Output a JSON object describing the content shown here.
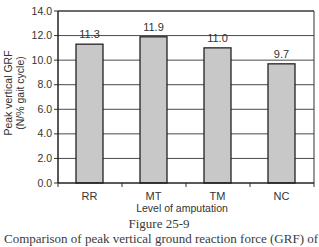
{
  "chart_data": {
    "type": "bar",
    "title": "",
    "categories": [
      "RR",
      "MT",
      "TM",
      "NC"
    ],
    "values": [
      11.3,
      11.9,
      11.0,
      9.7
    ],
    "data_labels": [
      "11.3",
      "11.9",
      "11.0",
      "9.7"
    ],
    "xlabel": "Level of amputation",
    "ylabel_lines": [
      "Peak vertical GRF",
      "(N/% gait cycle)"
    ],
    "ylim": [
      0,
      14
    ],
    "yticks": [
      0,
      2,
      4,
      6,
      8,
      10,
      12,
      14
    ],
    "ytick_labels": [
      "0.0",
      "2.0",
      "4.0",
      "6.0",
      "8.0",
      "10.0",
      "12.0",
      "14.0"
    ],
    "grid": true,
    "legend": "none",
    "bar_color": "#c8c8c8",
    "bar_edge_color": "#222222"
  },
  "figure": {
    "number": "Figure 25-9",
    "caption": "Comparison of peak vertical ground reaction force (GRF) of"
  }
}
